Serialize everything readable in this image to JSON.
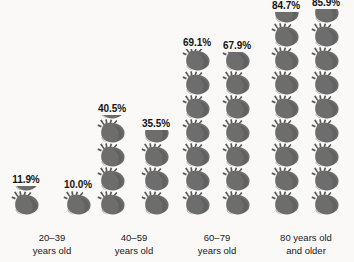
{
  "chart_data": {
    "type": "bar",
    "chart_style": "pictogram",
    "title": "",
    "subtitle": "",
    "xlabel": "",
    "ylabel": "",
    "unit": "percent",
    "icon": "anatomical-heart-icon",
    "icon_value": 10,
    "ylim": [
      0,
      90
    ],
    "grid": false,
    "legend": "none",
    "categories": [
      "20–39 years old",
      "40–59 years old",
      "60–79 years old",
      "80 years old and older"
    ],
    "series": [
      {
        "name": "bar-a",
        "values": [
          11.9,
          40.5,
          69.1,
          84.7
        ]
      },
      {
        "name": "bar-b",
        "values": [
          10.0,
          35.5,
          67.9,
          85.9
        ]
      }
    ],
    "values_flat": [
      11.9,
      10.0,
      40.5,
      35.5,
      69.1,
      67.9,
      84.7,
      85.9
    ]
  },
  "colors": {
    "background": "#faf9f7",
    "icon_fill": "#6d6d6d",
    "icon_fill_dark": "#585858",
    "icon_outline": "#4a4a4a",
    "text": "#141414"
  },
  "groups": [
    {
      "id": "group-20-39",
      "label_line1": "20–39",
      "label_line2": "years old",
      "bars": [
        {
          "id": "bar-20-39-a",
          "label": "11.9%",
          "value": 11.9,
          "full_icons": 1,
          "partial_fraction": 0.19
        },
        {
          "id": "bar-20-39-b",
          "label": "10.0%",
          "value": 10.0,
          "full_icons": 1,
          "partial_fraction": 0.0
        }
      ]
    },
    {
      "id": "group-40-59",
      "label_line1": "40–59",
      "label_line2": "years old",
      "bars": [
        {
          "id": "bar-40-59-a",
          "label": "40.5%",
          "value": 40.5,
          "full_icons": 4,
          "partial_fraction": 0.05
        },
        {
          "id": "bar-40-59-b",
          "label": "35.5%",
          "value": 35.5,
          "full_icons": 3,
          "partial_fraction": 0.55
        }
      ]
    },
    {
      "id": "group-60-79",
      "label_line1": "60–79",
      "label_line2": "years old",
      "bars": [
        {
          "id": "bar-60-79-a",
          "label": "69.1%",
          "value": 69.1,
          "full_icons": 6,
          "partial_fraction": 0.91
        },
        {
          "id": "bar-60-79-b",
          "label": "67.9%",
          "value": 67.9,
          "full_icons": 6,
          "partial_fraction": 0.79
        }
      ]
    },
    {
      "id": "group-80-plus",
      "label_line1": "80 years old",
      "label_line2": "and older",
      "bars": [
        {
          "id": "bar-80-plus-a",
          "label": "84.7%",
          "value": 84.7,
          "full_icons": 8,
          "partial_fraction": 0.47
        },
        {
          "id": "bar-80-plus-b",
          "label": "85.9%",
          "value": 85.9,
          "full_icons": 8,
          "partial_fraction": 0.59
        }
      ]
    }
  ]
}
